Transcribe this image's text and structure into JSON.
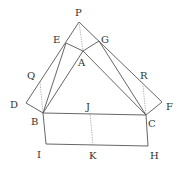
{
  "diagram": {
    "type": "geometry",
    "points": {
      "P": [
        79,
        22
      ],
      "E": [
        66,
        43
      ],
      "G": [
        99,
        41
      ],
      "A": [
        83,
        51
      ],
      "Q": [
        40,
        82
      ],
      "R": [
        143,
        86
      ],
      "D": [
        26,
        103
      ],
      "F": [
        162,
        102
      ],
      "B": [
        43,
        113
      ],
      "J": [
        90,
        113
      ],
      "C": [
        146,
        115
      ],
      "I": [
        46,
        144
      ],
      "K": [
        93,
        145
      ],
      "H": [
        148,
        146
      ]
    },
    "labels": {
      "P": "P",
      "E": "E",
      "G": "G",
      "A": "A",
      "Q": "Q",
      "R": "R",
      "D": "D",
      "F": "F",
      "B": "B",
      "J": "J",
      "C": "C",
      "I": "I",
      "K": "K",
      "H": "H"
    },
    "solid_segments": [
      [
        "P",
        "D"
      ],
      [
        "P",
        "F"
      ],
      [
        "D",
        "B"
      ],
      [
        "F",
        "C"
      ],
      [
        "E",
        "A"
      ],
      [
        "A",
        "G"
      ],
      [
        "E",
        "B"
      ],
      [
        "G",
        "C"
      ],
      [
        "A",
        "B"
      ],
      [
        "A",
        "C"
      ],
      [
        "B",
        "C"
      ],
      [
        "B",
        "I"
      ],
      [
        "I",
        "H"
      ],
      [
        "H",
        "C"
      ]
    ],
    "dotted_segments": [
      [
        "P",
        "A"
      ],
      [
        "Q",
        "B"
      ],
      [
        "R",
        "C"
      ],
      [
        "J",
        "K"
      ]
    ]
  }
}
